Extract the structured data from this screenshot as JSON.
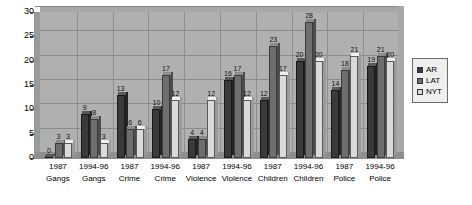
{
  "chart_data": {
    "type": "bar",
    "title": "",
    "xlabel": "",
    "ylabel": "",
    "ylim": [
      0,
      30
    ],
    "yticks": [
      0,
      5,
      10,
      15,
      20,
      25,
      30
    ],
    "grid": true,
    "legend_position": "right",
    "categories": [
      "1987 Gangs",
      "1994-96 Gangs",
      "1987 Crime",
      "1994-96 Crime",
      "1987 Violence",
      "1994-96 Violence",
      "1987 Children",
      "1994-96 Children",
      "1987 Police",
      "1994-96 Police"
    ],
    "category_lines": [
      [
        "1987",
        "Gangs"
      ],
      [
        "1994-96",
        "Gangs"
      ],
      [
        "1987",
        "Crime"
      ],
      [
        "1994-96",
        "Crime"
      ],
      [
        "1987",
        "Violence"
      ],
      [
        "1994-96",
        "Violence"
      ],
      [
        "1987",
        "Children"
      ],
      [
        "1994-96",
        "Children"
      ],
      [
        "1987",
        "Police"
      ],
      [
        "1994-96",
        "Police"
      ]
    ],
    "series": [
      {
        "name": "AR",
        "color": "#3a3a3a",
        "values": [
          0,
          9,
          13,
          10,
          4,
          16,
          12,
          20,
          14,
          19
        ]
      },
      {
        "name": "LAT",
        "color": "#6e6e6e",
        "values": [
          3,
          8,
          6,
          17,
          4,
          17,
          23,
          28,
          18,
          21
        ]
      },
      {
        "name": "NYT",
        "color": "#dadada",
        "values": [
          3,
          3,
          6,
          12,
          12,
          12,
          17,
          20,
          21,
          20
        ]
      }
    ]
  },
  "legend": {
    "entries": [
      {
        "label": "AR"
      },
      {
        "label": "LAT"
      },
      {
        "label": "NYT"
      }
    ]
  }
}
